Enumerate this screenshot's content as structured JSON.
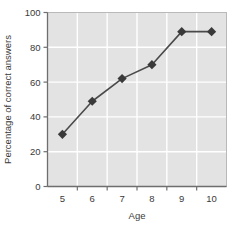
{
  "chart_data": {
    "type": "line",
    "title": "",
    "xlabel": "Age",
    "ylabel": "Percentage of correct answers",
    "categories": [
      5,
      6,
      7,
      8,
      9,
      10
    ],
    "x_tick_labels": [
      "5",
      "6",
      "7",
      "8",
      "9",
      "10"
    ],
    "y_tick_labels": [
      "0",
      "20",
      "40",
      "60",
      "80",
      "100"
    ],
    "y_ticks": [
      0,
      20,
      40,
      60,
      80,
      100
    ],
    "values": [
      30,
      49,
      62,
      70,
      89,
      89
    ],
    "series": [
      {
        "name": "Percentage of correct answers",
        "values": [
          30,
          49,
          62,
          70,
          89,
          89
        ]
      }
    ],
    "xlim": [
      4.5,
      10.5
    ],
    "ylim": [
      0,
      100
    ],
    "grid": true,
    "grid_color": "#ffffff",
    "plot_background": "#e3e3e3",
    "line_color": "#4a4a4a",
    "marker": "diamond",
    "marker_color": "#3a3a3a",
    "legend": "none",
    "axis_color": "#6e6e6e"
  },
  "axes": {
    "x_axis_label": "Age",
    "y_axis_label": "Percentage of correct answers"
  }
}
